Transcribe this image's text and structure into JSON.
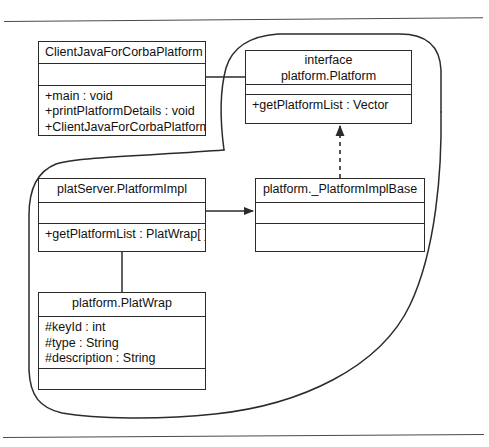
{
  "diagram": {
    "stroke_color": "#2b2b2b",
    "background": "#ffffff"
  },
  "rules": {
    "top": "horizontal-rule",
    "bottom": "horizontal-rule"
  },
  "packages": [
    {
      "id": "upper-package",
      "label": ""
    },
    {
      "id": "lower-package",
      "label": ""
    }
  ],
  "classes": {
    "client": {
      "name": "ClientJavaForCorbaPlatform",
      "attributes": [],
      "operations": [
        "+main : void",
        "+printPlatformDetails : void",
        "+ClientJavaForCorbaPlatform :"
      ]
    },
    "interface": {
      "stereotype": "interface",
      "name": "platform.Platform",
      "attributes": [],
      "operations": [
        "+getPlatformList : Vector"
      ]
    },
    "impl": {
      "name": "platServer.PlatformImpl",
      "attributes": [],
      "operations": [
        "+getPlatformList : PlatWrap[ ]"
      ]
    },
    "implbase": {
      "name": "platform._PlatformImplBase",
      "attributes": [],
      "operations": []
    },
    "platwrap": {
      "name": "platform.PlatWrap",
      "attributes": [
        "#keyId : int",
        "#type : String",
        "#description : String"
      ],
      "operations": []
    }
  },
  "connectors": [
    {
      "id": "client-to-interface",
      "from": "client",
      "to": "interface",
      "style": "solid",
      "arrow": "none"
    },
    {
      "id": "implbase-to-interface",
      "from": "implbase",
      "to": "interface",
      "style": "dashed",
      "arrow": "closed-filled"
    },
    {
      "id": "impl-to-implbase",
      "from": "impl",
      "to": "implbase",
      "style": "solid",
      "arrow": "filled"
    },
    {
      "id": "impl-to-platwrap",
      "from": "impl",
      "to": "platwrap",
      "style": "solid",
      "arrow": "none"
    }
  ]
}
